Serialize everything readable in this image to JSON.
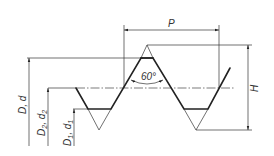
{
  "diagram": {
    "type": "thread-profile",
    "labels": {
      "pitch": "P",
      "height": "H",
      "angle": "60°",
      "major_diameter": {
        "main": "D",
        "sep": ", ",
        "alt": "d"
      },
      "pitch_diameter": {
        "main": "D",
        "main_sub": "2",
        "sep": ", ",
        "alt": "d",
        "alt_sub": "2"
      },
      "minor_diameter": {
        "main": "D",
        "main_sub": "1",
        "sep": ", ",
        "alt": "d",
        "alt_sub": "1"
      }
    },
    "colors": {
      "line": "#222222",
      "background": "#ffffff"
    }
  }
}
